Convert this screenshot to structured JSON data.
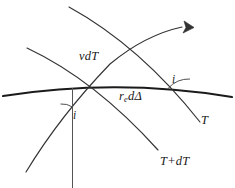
{
  "figure": {
    "background_color": "#ffffff",
    "line_color": "#2b2b2b",
    "surface_color": "#1a1a1a",
    "text_color": "#1a1a1a",
    "width": 235,
    "height": 188
  },
  "labels": {
    "wavefront_t": "T",
    "wavefront_tdt": "T+dT",
    "ray_segment": "vdT",
    "surface_segment_main": "r",
    "surface_segment_sub": "e",
    "surface_segment_rest": "dΔ",
    "angle_lower": "i",
    "angle_right": "i"
  },
  "elements": {
    "earth_surface": "earth-surface-arc",
    "ray_path": "curved-ray-with-arrow",
    "wavefront_t_line": "wavefront-t",
    "wavefront_tdt_line": "wavefront-t-plus-dt",
    "normal_line": "vertical-normal-line",
    "angle_arc_lower": "incidence-angle-arc-lower",
    "angle_arc_right": "incidence-angle-arc-right",
    "arrow_head": "ray-direction-arrowhead"
  }
}
